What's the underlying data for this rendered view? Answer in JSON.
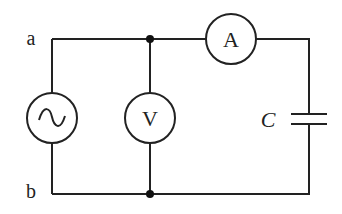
{
  "diagram": {
    "type": "circuit",
    "terminals": {
      "a": "a",
      "b": "b"
    },
    "components": {
      "source": {
        "kind": "ac-source",
        "symbol": "~"
      },
      "voltmeter": {
        "kind": "voltmeter",
        "label": "V"
      },
      "ammeter": {
        "kind": "ammeter",
        "label": "A"
      },
      "capacitor": {
        "kind": "capacitor",
        "label": "C"
      }
    },
    "colors": {
      "line": "#222222",
      "background": "#ffffff"
    }
  }
}
